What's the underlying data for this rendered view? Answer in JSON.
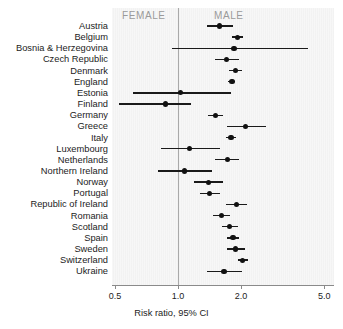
{
  "chart_data": {
    "type": "scatter",
    "subtype": "forest-plot",
    "title": "",
    "xlabel": "Risk ratio, 95% CI",
    "ylabel": "",
    "xscale": "log",
    "xlim": [
      0.5,
      5.0
    ],
    "xticks": [
      0.5,
      1.0,
      2.0,
      5.0
    ],
    "xtick_labels": [
      "0.5",
      "1.0",
      "2.0",
      "5.0"
    ],
    "reference_line": 1.0,
    "grid": false,
    "legend": "none",
    "group_annotations": [
      {
        "label": "FEMALE",
        "side": "left"
      },
      {
        "label": "MALE",
        "side": "right"
      }
    ],
    "categories": [
      "Austria",
      "Belgium",
      "Bosnia & Herzegovina",
      "Czech Republic",
      "Denmark",
      "England",
      "Estonia",
      "Finland",
      "Germany",
      "Greece",
      "Italy",
      "Luxembourg",
      "Netherlands",
      "Northern Ireland",
      "Norway",
      "Portugal",
      "Republic of Ireland",
      "Romania",
      "Scotland",
      "Spain",
      "Sweden",
      "Switzerland",
      "Ukraine"
    ],
    "values": [
      1.58,
      1.93,
      1.85,
      1.7,
      1.89,
      1.81,
      1.03,
      0.87,
      1.51,
      2.1,
      1.79,
      1.14,
      1.72,
      1.07,
      1.4,
      1.42,
      1.9,
      1.61,
      1.77,
      1.83,
      1.89,
      2.04,
      1.66
    ],
    "ci_low": [
      1.38,
      1.82,
      0.94,
      1.5,
      1.76,
      1.74,
      0.61,
      0.52,
      1.39,
      1.71,
      1.7,
      0.83,
      1.51,
      0.8,
      1.19,
      1.28,
      1.7,
      1.47,
      1.62,
      1.71,
      1.72,
      1.93,
      1.37
    ],
    "ci_high": [
      1.83,
      2.05,
      4.2,
      1.95,
      2.03,
      1.88,
      1.79,
      1.15,
      1.64,
      2.62,
      1.89,
      1.58,
      1.95,
      1.45,
      1.64,
      1.58,
      2.13,
      1.77,
      1.94,
      1.96,
      2.08,
      2.16,
      2.03
    ],
    "series": [
      {
        "name": "Risk ratio (male vs female)",
        "values": [
          1.58,
          1.93,
          1.85,
          1.7,
          1.89,
          1.81,
          1.03,
          0.87,
          1.51,
          2.1,
          1.79,
          1.14,
          1.72,
          1.07,
          1.4,
          1.42,
          1.9,
          1.61,
          1.77,
          1.83,
          1.89,
          2.04,
          1.66
        ]
      }
    ]
  },
  "colors": {
    "panel_background": "#f7f7f7",
    "reference_line": "#a9a9a9",
    "marker": "#111111",
    "group_label": "#9a9a9a",
    "text": "#1c1c1c",
    "axis": "#8a8a8a"
  }
}
